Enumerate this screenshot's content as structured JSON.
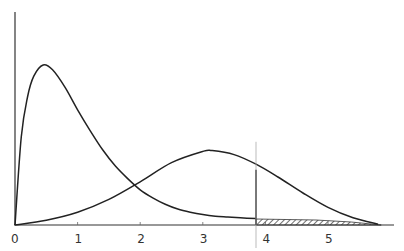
{
  "chart_data": {
    "type": "line",
    "title": "",
    "xlabel": "",
    "ylabel": "",
    "xlim": [
      0,
      5.9
    ],
    "grid": false,
    "legend": null,
    "x_ticks": [
      "0",
      "1",
      "2",
      "3",
      "4",
      "5"
    ],
    "series": [
      {
        "name": "distribution A (right-skewed, peak ~0.45)",
        "points": [
          [
            0,
            0
          ],
          [
            0.1,
            0.55
          ],
          [
            0.2,
            0.8
          ],
          [
            0.3,
            0.93
          ],
          [
            0.45,
            1.0
          ],
          [
            0.6,
            0.97
          ],
          [
            0.8,
            0.86
          ],
          [
            1.0,
            0.72
          ],
          [
            1.2,
            0.59
          ],
          [
            1.4,
            0.47
          ],
          [
            1.6,
            0.37
          ],
          [
            1.8,
            0.29
          ],
          [
            2.0,
            0.22
          ],
          [
            2.2,
            0.17
          ],
          [
            2.4,
            0.13
          ],
          [
            2.6,
            0.1
          ],
          [
            2.8,
            0.08
          ],
          [
            3.0,
            0.065
          ],
          [
            3.2,
            0.055
          ],
          [
            3.4,
            0.05
          ],
          [
            3.6,
            0.045
          ],
          [
            3.85,
            0.04
          ]
        ]
      },
      {
        "name": "distribution B (peak ~3.15)",
        "points": [
          [
            0,
            0
          ],
          [
            0.5,
            0.03
          ],
          [
            1.0,
            0.08
          ],
          [
            1.5,
            0.16
          ],
          [
            2.0,
            0.27
          ],
          [
            2.5,
            0.39
          ],
          [
            3.0,
            0.46
          ],
          [
            3.15,
            0.465
          ],
          [
            3.5,
            0.44
          ],
          [
            3.85,
            0.38
          ],
          [
            4.2,
            0.3
          ],
          [
            4.6,
            0.2
          ],
          [
            5.0,
            0.11
          ],
          [
            5.4,
            0.045
          ],
          [
            5.8,
            0.005
          ]
        ]
      }
    ],
    "annotations": {
      "critical_value_line_x": 3.85,
      "shaded_region": {
        "from": 3.85,
        "to": 5.85,
        "style": "hatched"
      }
    }
  }
}
